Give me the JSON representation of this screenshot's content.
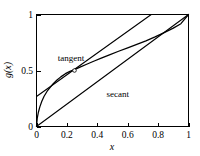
{
  "chart_data": {
    "type": "line",
    "title": "",
    "xlabel": "x",
    "ylabel": "g(x)",
    "xlim": [
      0,
      1
    ],
    "ylim": [
      0,
      1
    ],
    "grid": false,
    "legend": "inline-annotations",
    "xticks": [
      0,
      0.2,
      0.4,
      0.6,
      0.8,
      1
    ],
    "xtick_labels": [
      "0",
      "0.2",
      "0.4",
      "0.6",
      "0.8",
      "1"
    ],
    "yticks": [
      0,
      0.5,
      1
    ],
    "ytick_labels": [
      "0",
      "0.5",
      "1"
    ],
    "annotations": [
      {
        "text": "tangent",
        "x": 0.14,
        "y": 0.585
      },
      {
        "text": "secant",
        "x": 0.46,
        "y": 0.265
      }
    ],
    "markers": [
      {
        "name": "tangency-point",
        "x": 0.25,
        "y": 0.5
      }
    ],
    "series": [
      {
        "name": "g(x)",
        "role": "curve",
        "x": [
          0,
          0.005,
          0.012,
          0.022,
          0.035,
          0.05,
          0.07,
          0.09,
          0.11,
          0.135,
          0.16,
          0.19,
          0.22,
          0.25,
          0.29,
          0.33,
          0.38,
          0.43,
          0.48,
          0.54,
          0.6,
          0.66,
          0.72,
          0.78,
          0.84,
          0.9,
          0.95,
          1
        ],
        "y": [
          0,
          0.075,
          0.125,
          0.175,
          0.225,
          0.27,
          0.315,
          0.35,
          0.382,
          0.415,
          0.443,
          0.472,
          0.492,
          0.508,
          0.532,
          0.556,
          0.585,
          0.613,
          0.64,
          0.672,
          0.702,
          0.733,
          0.765,
          0.8,
          0.838,
          0.878,
          0.918,
          1
        ]
      },
      {
        "name": "tangent",
        "role": "line",
        "x": [
          0,
          0.755
        ],
        "y": [
          0.268,
          1.0
        ]
      },
      {
        "name": "secant",
        "role": "line",
        "x": [
          0,
          1
        ],
        "y": [
          0,
          1
        ]
      }
    ]
  },
  "axes": {
    "x_title": "x",
    "y_title": "g(x)"
  }
}
